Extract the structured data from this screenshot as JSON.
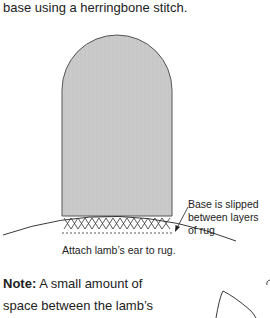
{
  "intro_text": "base using a herringbone stitch.",
  "figure": {
    "callout": [
      "Base is slipped",
      "between layers",
      "of rug"
    ],
    "caption": "Attach lamb’s ear to rug.",
    "colors": {
      "ear_fill": "#c8c8c8",
      "ear_stroke": "#555555",
      "line": "#222222"
    }
  },
  "note": {
    "label": "Note:",
    "lines": [
      "A small amount of",
      "space between the lamb’s"
    ]
  }
}
